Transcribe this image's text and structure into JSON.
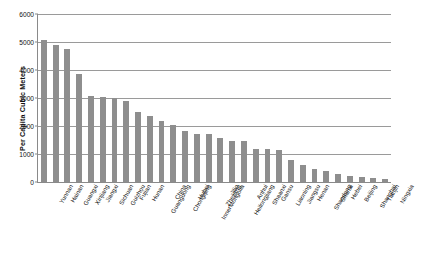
{
  "chart_data": {
    "type": "bar",
    "title": "",
    "subtitle": "",
    "xlabel": "",
    "ylabel": "Per Capita Cubic Meters",
    "ylim": [
      0,
      6000
    ],
    "ytick_labels": [
      "0",
      "1000",
      "2000",
      "3000",
      "4000",
      "5000",
      "6000"
    ],
    "ytick_values": [
      0,
      1000,
      2000,
      3000,
      4000,
      5000,
      6000
    ],
    "grid": true,
    "legend": null,
    "bar_color": "#8e8e8e",
    "categories": [
      "Yunnan",
      "Hainan",
      "Guangxi",
      "Xinjiang",
      "Jiangxi",
      "Sichuan",
      "Guizhou",
      "Fujian",
      "Hunan",
      "Guangdong",
      "China",
      "Chongqing",
      "Hubei",
      "InnerMongolia",
      "Zhejiang",
      "Jilin",
      "Heilongjiang",
      "Anhui",
      "Shaanxi",
      "Gansu",
      "Liaoning",
      "Jiangsu",
      "Henan",
      "Shandong",
      "Shanxi",
      "Hebei",
      "Beijing",
      "Shanghai",
      "Tianjin",
      "Ningxia"
    ],
    "values": [
      5080,
      4900,
      4740,
      3840,
      3070,
      3040,
      3000,
      2880,
      2500,
      2350,
      2180,
      2030,
      1820,
      1720,
      1700,
      1560,
      1480,
      1450,
      1190,
      1180,
      1130,
      780,
      620,
      480,
      390,
      300,
      230,
      180,
      140,
      100
    ]
  }
}
